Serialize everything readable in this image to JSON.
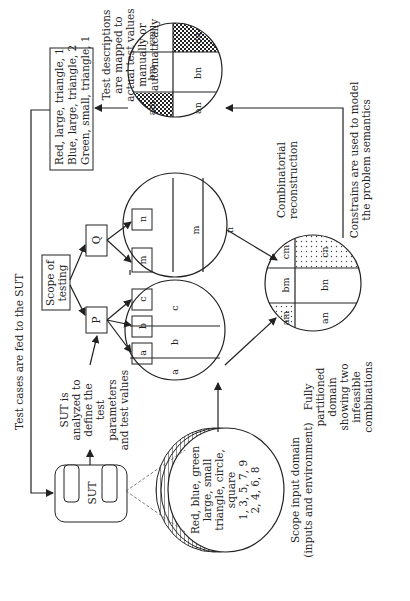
{
  "diagram": {
    "orientation": "rotated-90-ccw",
    "feedback_top": {
      "label": "Test cases are fed to the SUT"
    },
    "test_cases_box": {
      "lines": [
        "Red, large, triangle, 1",
        "Blue, large, triangle, 2",
        "Green, small, triangle, 1"
      ]
    },
    "mapping_note": {
      "lines": [
        "Test descriptions",
        "are mapped to",
        "actual test values",
        "manually or",
        "automatically"
      ]
    },
    "sut": {
      "label": "SUT"
    },
    "sut_note": {
      "lines": [
        "SUT is",
        "analyzed to",
        "define the",
        "test",
        "parameters",
        "and test values"
      ]
    },
    "scope_box": {
      "lines": [
        "Scope of",
        "testing"
      ]
    },
    "tree": {
      "p": "P",
      "q": "Q",
      "p_children": [
        "a",
        "b",
        "c"
      ],
      "q_children": [
        "m",
        "n"
      ]
    },
    "input_domain": {
      "lines": [
        "Red, blue, green",
        "large, small",
        "triangle, circle,",
        "square",
        "1, 3, 5, 7, 9",
        "2, 4, 6, 8"
      ],
      "caption": [
        "Scope input domain",
        "(inputs and environment)"
      ]
    },
    "partition_abc": {
      "cells": [
        "a",
        "b",
        "c"
      ]
    },
    "partition_mn": {
      "cells": [
        "m",
        "n"
      ]
    },
    "combinatorial_note": {
      "lines": [
        "Combinatorial",
        "reconstruction"
      ]
    },
    "full_partition": {
      "cells": [
        "am",
        "bm",
        "cm",
        "an",
        "bn",
        "cn"
      ],
      "infeasible": [
        "am",
        "cn"
      ],
      "caption": [
        "Fully",
        "partitioned",
        "domain",
        "showing two",
        "infeasible",
        "combinations"
      ]
    },
    "constraints_note": {
      "lines": [
        "Constrains are used to model",
        "the problem semantics"
      ]
    },
    "constrained_partition": {
      "cells": [
        "am",
        "bm",
        "cm",
        "an",
        "bn",
        "cn"
      ],
      "excluded": [
        "am",
        "cn"
      ]
    },
    "colors": {
      "stroke": "#222222",
      "background": "#ffffff"
    }
  }
}
